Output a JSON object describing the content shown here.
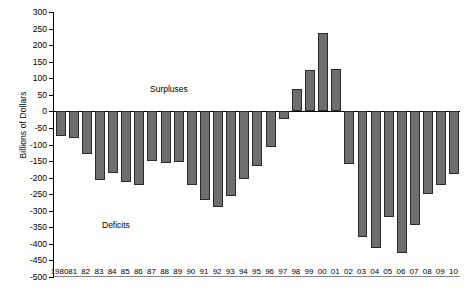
{
  "chart_data": {
    "type": "bar",
    "title": "",
    "xlabel": "",
    "ylabel": "Billions of Dollars",
    "ylim": [
      -500,
      300
    ],
    "ytick_step": 50,
    "grid": false,
    "legend": "none",
    "bar_color": "#6e6e6e",
    "bar_edge_color": "#2a2a2a",
    "yticks": [
      300,
      250,
      200,
      150,
      100,
      50,
      0,
      -50,
      -100,
      -150,
      -200,
      -250,
      -300,
      -350,
      -400,
      -450,
      -500
    ],
    "ytick_labels": [
      "300",
      "250",
      "200",
      "150",
      "100",
      "50",
      "0",
      "-50",
      "-100",
      "-150",
      "-200",
      "-250",
      "-300",
      "-350",
      "-400",
      "-450",
      "-500"
    ],
    "categories": [
      "1980",
      "81",
      "82",
      "83",
      "84",
      "85",
      "86",
      "87",
      "88",
      "89",
      "90",
      "91",
      "92",
      "93",
      "94",
      "95",
      "96",
      "97",
      "98",
      "99",
      "00",
      "01",
      "02",
      "03",
      "04",
      "05",
      "06",
      "07",
      "08",
      "09",
      "10"
    ],
    "values": [
      -74,
      -79,
      -128,
      -208,
      -185,
      -212,
      -221,
      -150,
      -155,
      -153,
      -221,
      -269,
      -290,
      -255,
      -203,
      -164,
      -107,
      -22,
      69,
      126,
      236,
      128,
      -158,
      -378,
      -413,
      -318,
      -428,
      -344,
      -248,
      -222,
      -190
    ],
    "annotations": [
      {
        "text": "Surpluses",
        "x": "1989",
        "y": 130
      },
      {
        "text": "Deficits",
        "x": "1984",
        "y": -330
      }
    ]
  }
}
